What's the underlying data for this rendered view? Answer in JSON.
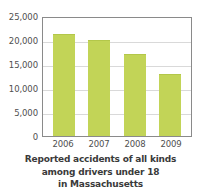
{
  "chart_data": {
    "type": "bar",
    "title": "",
    "categories": [
      "2006",
      "2007",
      "2008",
      "2009"
    ],
    "values": [
      21300,
      20100,
      17000,
      13000
    ],
    "xlabel": "",
    "ylabel": "",
    "ylim": [
      0,
      25000
    ],
    "y_ticks": [
      0,
      5000,
      10000,
      15000,
      20000,
      25000
    ],
    "y_tick_labels": [
      "0",
      "5,000",
      "10,000",
      "15,000",
      "20,000",
      "25,000"
    ],
    "grid": true,
    "legend": false,
    "bar_color": "#c2d457",
    "caption_lines": [
      "Reported accidents of all kinds",
      "among drivers under 18",
      "in Massachusetts"
    ]
  }
}
